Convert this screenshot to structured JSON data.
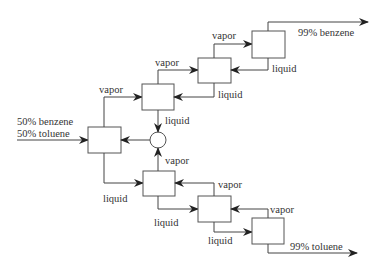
{
  "diagram": {
    "title": "",
    "type": "distillation cascade flow diagram",
    "feed": {
      "line1": "50% benzene",
      "line2": "50% toluene"
    },
    "outputs": {
      "top": "99% benzene",
      "bottom": "99% toluene"
    },
    "stream_labels": {
      "vapor": "vapor",
      "liquid": "liquid"
    },
    "units": [
      {
        "id": "feed-stage",
        "position": "center-left"
      },
      {
        "id": "upper-stage-1",
        "position": "upper"
      },
      {
        "id": "upper-stage-2",
        "position": "upper"
      },
      {
        "id": "upper-stage-3",
        "position": "upper-top"
      },
      {
        "id": "lower-stage-1",
        "position": "lower"
      },
      {
        "id": "lower-stage-2",
        "position": "lower"
      },
      {
        "id": "lower-stage-3",
        "position": "lower-bottom"
      },
      {
        "id": "mixer",
        "shape": "circle"
      }
    ],
    "colors": {
      "stroke": "#444444",
      "text": "#333333",
      "background": "#ffffff"
    }
  }
}
